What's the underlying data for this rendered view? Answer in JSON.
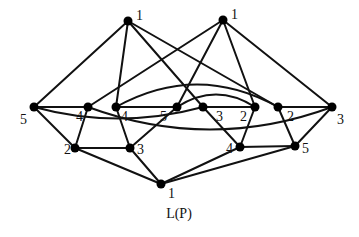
{
  "diagram": {
    "caption": "L(P)",
    "type": "lattice-graph",
    "colors": {
      "line": "#111111",
      "node": "#000000",
      "background": "#ffffff"
    },
    "nodes": [
      {
        "id": "T1",
        "label": "1",
        "x": 128,
        "y": 21,
        "lx": 136,
        "ly": 20
      },
      {
        "id": "T2",
        "label": "1",
        "x": 223,
        "y": 20,
        "lx": 231,
        "ly": 19
      },
      {
        "id": "A5",
        "label": "5",
        "x": 34,
        "y": 107,
        "lx": 20,
        "ly": 124
      },
      {
        "id": "B4",
        "label": "4",
        "x": 88,
        "y": 107,
        "lx": 76,
        "ly": 121
      },
      {
        "id": "C4",
        "label": "4",
        "x": 116,
        "y": 107,
        "lx": 121,
        "ly": 121
      },
      {
        "id": "D5",
        "label": "5",
        "x": 177,
        "y": 107,
        "lx": 160,
        "ly": 121
      },
      {
        "id": "E3",
        "label": "3",
        "x": 203,
        "y": 107,
        "lx": 216,
        "ly": 121
      },
      {
        "id": "F2",
        "label": "2",
        "x": 255,
        "y": 107,
        "lx": 240,
        "ly": 121
      },
      {
        "id": "G2",
        "label": "2",
        "x": 278,
        "y": 107,
        "lx": 287,
        "ly": 121
      },
      {
        "id": "H3",
        "label": "3",
        "x": 332,
        "y": 107,
        "lx": 337,
        "ly": 124
      },
      {
        "id": "L2",
        "label": "2",
        "x": 75,
        "y": 148,
        "lx": 64,
        "ly": 154
      },
      {
        "id": "L3",
        "label": "3",
        "x": 130,
        "y": 148,
        "lx": 137,
        "ly": 154
      },
      {
        "id": "R4",
        "label": "4",
        "x": 240,
        "y": 147,
        "lx": 226,
        "ly": 153
      },
      {
        "id": "R5",
        "label": "5",
        "x": 295,
        "y": 146,
        "lx": 302,
        "ly": 153
      },
      {
        "id": "BOT",
        "label": "1",
        "x": 161,
        "y": 184,
        "lx": 168,
        "ly": 198
      }
    ],
    "edges": [
      [
        "T1",
        "A5"
      ],
      [
        "T1",
        "C4"
      ],
      [
        "T1",
        "E3"
      ],
      [
        "T1",
        "G2"
      ],
      [
        "T2",
        "B4"
      ],
      [
        "T2",
        "D5"
      ],
      [
        "T2",
        "F2"
      ],
      [
        "T2",
        "H3"
      ],
      [
        "A5",
        "B4"
      ],
      [
        "C4",
        "D5"
      ],
      [
        "E3",
        "F2"
      ],
      [
        "G2",
        "H3"
      ],
      [
        "A5",
        "L2"
      ],
      [
        "B4",
        "L2"
      ],
      [
        "C4",
        "L3"
      ],
      [
        "D5",
        "L3"
      ],
      [
        "E3",
        "R4"
      ],
      [
        "F2",
        "R4"
      ],
      [
        "G2",
        "R5"
      ],
      [
        "H3",
        "R5"
      ],
      [
        "L2",
        "L3"
      ],
      [
        "R4",
        "R5"
      ],
      [
        "L2",
        "BOT"
      ],
      [
        "L3",
        "BOT"
      ],
      [
        "R4",
        "BOT"
      ],
      [
        "R5",
        "BOT"
      ]
    ],
    "curved_edges": [
      {
        "from": "C4",
        "to": "G2",
        "cx": 197,
        "cy": 62
      },
      {
        "from": "D5",
        "to": "F2",
        "cx": 216,
        "cy": 82
      },
      {
        "from": "A5",
        "to": "E3",
        "cx": 118,
        "cy": 130
      },
      {
        "from": "B4",
        "to": "H3",
        "cx": 210,
        "cy": 152
      }
    ]
  }
}
